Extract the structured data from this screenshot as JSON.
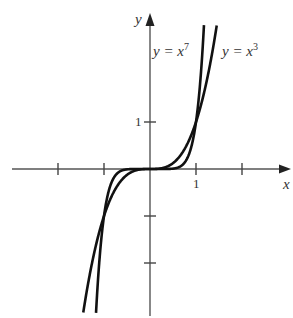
{
  "chart_data": {
    "type": "line",
    "title": "",
    "xlabel": "x",
    "ylabel": "y",
    "xlim": [
      -3,
      3
    ],
    "ylim": [
      -3,
      3
    ],
    "x_ticks": [
      -2,
      -1,
      1,
      2
    ],
    "y_ticks": [
      -2,
      -1,
      1
    ],
    "x_tick_labels": {
      "1": "1"
    },
    "y_tick_labels": {
      "1": "1"
    },
    "grid": false,
    "series": [
      {
        "name": "y = x^7",
        "label_base": "y = x",
        "label_exp": "7",
        "function": "x^7",
        "color": "#111111"
      },
      {
        "name": "y = x^3",
        "label_base": "y = x",
        "label_exp": "3",
        "function": "x^3",
        "color": "#111111"
      }
    ],
    "intersections": [
      [
        -1,
        -1
      ],
      [
        0,
        0
      ],
      [
        1,
        1
      ]
    ]
  },
  "layout": {
    "origin_px": [
      150,
      169
    ],
    "unit_x_px": 46,
    "unit_y_px": 47
  }
}
